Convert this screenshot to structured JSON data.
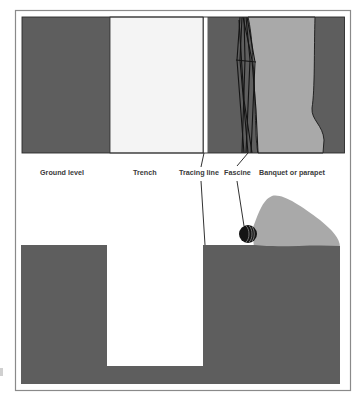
{
  "diagram": {
    "colors": {
      "ground": "#5e5e5e",
      "trench": "#f4f4f4",
      "parapet": "#a9a9a9",
      "fascine": "#141414",
      "frame": "#8a8a8a",
      "leader": "#1a1a1a"
    },
    "labels": {
      "ground_level": "Ground level",
      "trench": "Trench",
      "tracing_line": "Tracing line",
      "fascine": "Fascine",
      "banquet": "Banquet or parapet"
    },
    "views": [
      {
        "name": "plan-view",
        "description": "Top-down view"
      },
      {
        "name": "cross-section",
        "description": "Side section view"
      }
    ]
  }
}
